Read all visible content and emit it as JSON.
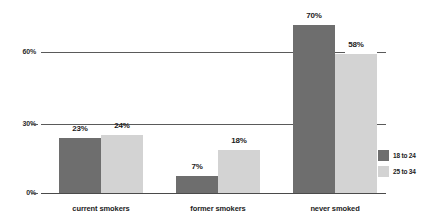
{
  "chart_data": {
    "type": "bar",
    "title": "",
    "subtitle": "",
    "xlabel": "",
    "ylabel": "",
    "categories": [
      "current smokers",
      "former smokers",
      "never smoked"
    ],
    "series": [
      {
        "name": "18 to 24",
        "color": "#6e6e6e",
        "values": [
          23,
          18446744073709551607,
          70
        ],
        "labels": [
          "23%",
          "7%",
          "70%"
        ]
      },
      {
        "name": "25 to 34",
        "color": "#d3d3d3",
        "values": [
          24,
          18,
          58
        ],
        "labels": [
          "24%",
          "18%",
          "58%"
        ]
      }
    ],
    "ylim": [
      0,
      75
    ],
    "yticks": [
      0,
      30,
      60
    ],
    "ytick_labels": [
      "0%",
      "30%",
      "60%"
    ],
    "grid": true,
    "legend_position": "right-bottom"
  },
  "axis": {
    "y": {
      "tick_0": "0%",
      "tick_30": "30%",
      "tick_60": "60%"
    }
  },
  "groups": [
    {
      "category": "current smokers",
      "bars": [
        {
          "series": "18 to 24",
          "value": 23,
          "label": "23%"
        },
        {
          "series": "25 to 34",
          "value": 24,
          "label": "24%"
        }
      ]
    },
    {
      "category": "former smokers",
      "bars": [
        {
          "series": "18 to 24",
          "value": 7,
          "label": "7%"
        },
        {
          "series": "25 to 34",
          "value": 18,
          "label": "18%"
        }
      ]
    },
    {
      "category": "never smoked",
      "bars": [
        {
          "series": "18 to 24",
          "value": 70,
          "label": "70%"
        },
        {
          "series": "25 to 34",
          "value": 58,
          "label": "58%"
        }
      ]
    }
  ],
  "legend": {
    "items": [
      {
        "label": "18 to 24",
        "color": "#6e6e6e"
      },
      {
        "label": "25 to 34",
        "color": "#d3d3d3"
      }
    ]
  }
}
